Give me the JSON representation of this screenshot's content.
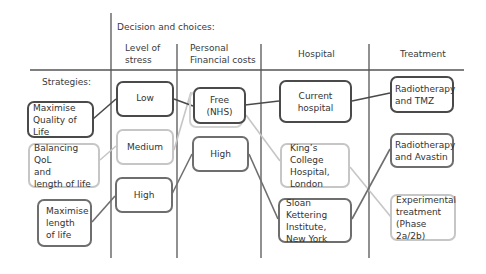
{
  "header": {
    "title": "Decision and choices:",
    "strategies_label": "Strategies:",
    "columns": [
      {
        "id": "stress",
        "label": "Level of\nstress"
      },
      {
        "id": "cost",
        "label": "Personal\nFinancial costs"
      },
      {
        "id": "hospital",
        "label": "Hospital"
      },
      {
        "id": "treatment",
        "label": "Treatment"
      }
    ]
  },
  "strategies": [
    {
      "id": "max-qol",
      "label": "Maximise\nQuality of Life",
      "tone": "dark"
    },
    {
      "id": "balance",
      "label": "Balancing QoL\nand\nlength of life",
      "tone": "light"
    },
    {
      "id": "max-length",
      "label": "Maximise\nlength\nof life",
      "tone": "mid"
    }
  ],
  "stress": [
    {
      "id": "low",
      "label": "Low",
      "tone": "dark"
    },
    {
      "id": "medium",
      "label": "Medium",
      "tone": "light"
    },
    {
      "id": "high",
      "label": "High",
      "tone": "mid"
    }
  ],
  "cost": [
    {
      "id": "free",
      "label": "Free\n(NHS)",
      "tone": "dark"
    },
    {
      "id": "high",
      "label": "High",
      "tone": "mid"
    }
  ],
  "hospital": [
    {
      "id": "current",
      "label": "Current hospital",
      "tone": "dark"
    },
    {
      "id": "kings",
      "label": "King’s College\nHospital,\nLondon",
      "tone": "light"
    },
    {
      "id": "sloan",
      "label": "Sloan Kettering\nInstitute,\nNew York",
      "tone": "mid"
    }
  ],
  "treatment": [
    {
      "id": "tmz",
      "label": "Radiotherapy\nand TMZ",
      "tone": "dark"
    },
    {
      "id": "avastin",
      "label": "Radiotherapy\nand Avastin",
      "tone": "mid"
    },
    {
      "id": "experimental",
      "label": "Experimental\ntreatment\n(Phase 2a/2b)",
      "tone": "light"
    }
  ],
  "paths": [
    {
      "strategy": "Maximise Quality of Life",
      "stress": "Low",
      "cost": "Free (NHS)",
      "hospital": "Current hospital",
      "treatment": "Radiotherapy and TMZ",
      "tone": "dark"
    },
    {
      "strategy": "Balancing QoL and length of life",
      "stress": "Medium",
      "cost": "Free (NHS)",
      "hospital": "King’s College Hospital, London",
      "treatment": "Experimental treatment (Phase 2a/2b)",
      "tone": "light"
    },
    {
      "strategy": "Maximise length of life",
      "stress": "High",
      "cost": "High",
      "hospital": "Sloan Kettering Institute, New York",
      "treatment": "Radiotherapy and Avastin",
      "tone": "mid"
    }
  ],
  "colors": {
    "dark": "#4a4a4a",
    "mid": "#6e6e6e",
    "light": "#c6c6c6",
    "grid": "#555555"
  }
}
